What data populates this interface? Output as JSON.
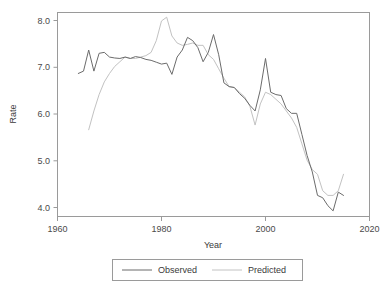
{
  "chart_data": {
    "type": "line",
    "title": "",
    "xlabel": "Year",
    "ylabel": "Rate",
    "xlim": [
      1960,
      2020
    ],
    "ylim": [
      3.85,
      8.2
    ],
    "grid": false,
    "legend_position": "bottom",
    "xticks": [
      1960,
      1980,
      2000,
      2020
    ],
    "xticklabels": [
      "1960",
      "1980",
      "2000",
      "2020"
    ],
    "yticks": [
      4.0,
      5.0,
      6.0,
      7.0,
      8.0
    ],
    "yticklabels": [
      "4.0",
      "5.0",
      "6.0",
      "7.0",
      "8.0"
    ],
    "series": [
      {
        "name": "Observed",
        "color": "#6b6b6b",
        "x": [
          1964,
          1965,
          1966,
          1967,
          1968,
          1969,
          1970,
          1971,
          1972,
          1973,
          1974,
          1975,
          1976,
          1977,
          1978,
          1979,
          1980,
          1981,
          1982,
          1983,
          1984,
          1985,
          1986,
          1987,
          1988,
          1989,
          1990,
          1991,
          1992,
          1993,
          1994,
          1995,
          1996,
          1997,
          1998,
          1999,
          2000,
          2001,
          2002,
          2003,
          2004,
          2005,
          2006,
          2007,
          2008,
          2009,
          2010,
          2011,
          2012,
          2013,
          2014,
          2015
        ],
        "values": [
          6.9,
          6.95,
          7.4,
          6.95,
          7.33,
          7.35,
          7.25,
          7.23,
          7.22,
          7.25,
          7.22,
          7.26,
          7.24,
          7.2,
          7.18,
          7.14,
          7.1,
          7.12,
          6.88,
          7.25,
          7.4,
          7.67,
          7.6,
          7.45,
          7.15,
          7.35,
          7.73,
          7.3,
          6.7,
          6.62,
          6.6,
          6.47,
          6.37,
          6.22,
          6.1,
          6.55,
          7.22,
          6.5,
          6.45,
          6.43,
          6.15,
          6.05,
          6.05,
          5.6,
          5.15,
          4.8,
          4.3,
          4.25,
          4.08,
          3.97,
          4.37,
          4.3
        ]
      },
      {
        "name": "Predicted",
        "color": "#c2c2c2",
        "x": [
          1966,
          1967,
          1968,
          1969,
          1970,
          1971,
          1972,
          1973,
          1974,
          1975,
          1976,
          1977,
          1978,
          1979,
          1980,
          1981,
          1982,
          1983,
          1984,
          1985,
          1986,
          1987,
          1988,
          1989,
          1990,
          1991,
          1992,
          1993,
          1994,
          1995,
          1996,
          1997,
          1998,
          1999,
          2000,
          2001,
          2002,
          2003,
          2004,
          2005,
          2006,
          2007,
          2008,
          2009,
          2010,
          2011,
          2012,
          2013,
          2014,
          2015
        ],
        "values": [
          5.7,
          6.1,
          6.45,
          6.72,
          6.9,
          7.05,
          7.15,
          7.25,
          7.22,
          7.22,
          7.25,
          7.28,
          7.35,
          7.6,
          8.02,
          8.1,
          7.7,
          7.55,
          7.5,
          7.52,
          7.55,
          7.5,
          7.5,
          7.3,
          7.2,
          7.0,
          6.8,
          6.62,
          6.6,
          6.5,
          6.4,
          6.2,
          5.8,
          6.25,
          6.5,
          6.45,
          6.35,
          6.25,
          6.1,
          5.95,
          5.75,
          5.4,
          5.05,
          4.85,
          4.75,
          4.4,
          4.3,
          4.3,
          4.4,
          4.75
        ]
      }
    ]
  },
  "legend": {
    "entries": [
      {
        "label": "Observed"
      },
      {
        "label": "Predicted"
      }
    ]
  },
  "axes": {
    "x_title": "Year",
    "y_title": "Rate"
  }
}
